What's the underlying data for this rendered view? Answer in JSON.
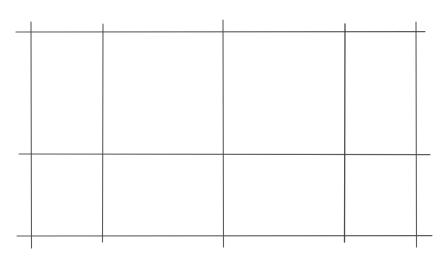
{
  "diagram": {
    "type": "hand-drawn grid",
    "line_color": "#4a4a4a",
    "background": "#ffffff",
    "horizontal_lines": [
      {
        "y": 32,
        "x1": 16,
        "x2": 425
      },
      {
        "y": 154,
        "x1": 19,
        "x2": 430
      },
      {
        "y": 236,
        "x1": 17,
        "x2": 432
      }
    ],
    "vertical_lines": [
      {
        "x": 31,
        "y1": 22,
        "y2": 248
      },
      {
        "x": 103,
        "y1": 24,
        "y2": 242
      },
      {
        "x": 223,
        "y1": 20,
        "y2": 247
      },
      {
        "x": 345,
        "y1": 24,
        "y2": 242
      },
      {
        "x": 416,
        "y1": 22,
        "y2": 247
      }
    ],
    "rows": 2,
    "columns": 4
  }
}
